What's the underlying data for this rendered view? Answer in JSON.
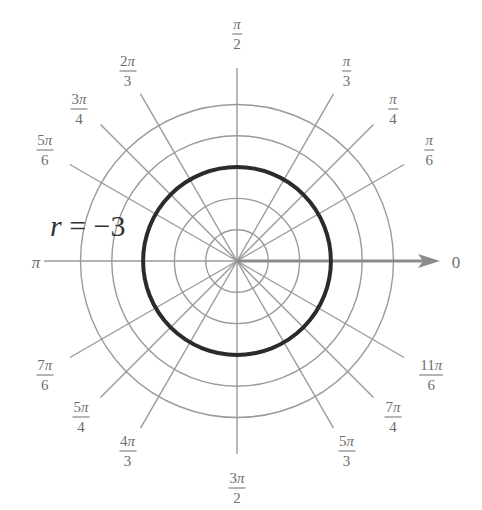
{
  "diagram": {
    "type": "polar-grid",
    "equation": {
      "variable": "r",
      "operator": "=",
      "value": "−3"
    },
    "center": {
      "x": 237,
      "y": 261
    },
    "ring_spacing_px": 31.3,
    "ring_count": 5,
    "highlight_ring_index": 3,
    "colors": {
      "grid": "#9a9a9a",
      "curve": "#2b2b2b",
      "axis": "#8c8c8c",
      "text": "#6e6e6e"
    },
    "polar_axis_label": "0",
    "angle_labels": [
      {
        "deg": 90,
        "num": "π",
        "den": "2"
      },
      {
        "deg": 60,
        "num": "π",
        "den": "3"
      },
      {
        "deg": 45,
        "num": "π",
        "den": "4"
      },
      {
        "deg": 30,
        "num": "π",
        "den": "6"
      },
      {
        "deg": 120,
        "num": "2π",
        "den": "3"
      },
      {
        "deg": 135,
        "num": "3π",
        "den": "4"
      },
      {
        "deg": 150,
        "num": "5π",
        "den": "6"
      },
      {
        "deg": 180,
        "num": "π",
        "den": ""
      },
      {
        "deg": 210,
        "num": "7π",
        "den": "6"
      },
      {
        "deg": 225,
        "num": "5π",
        "den": "4"
      },
      {
        "deg": 240,
        "num": "4π",
        "den": "3"
      },
      {
        "deg": 270,
        "num": "3π",
        "den": "2"
      },
      {
        "deg": 300,
        "num": "5π",
        "den": "3"
      },
      {
        "deg": 315,
        "num": "7π",
        "den": "4"
      },
      {
        "deg": 330,
        "num": "11π",
        "den": "6"
      }
    ]
  }
}
